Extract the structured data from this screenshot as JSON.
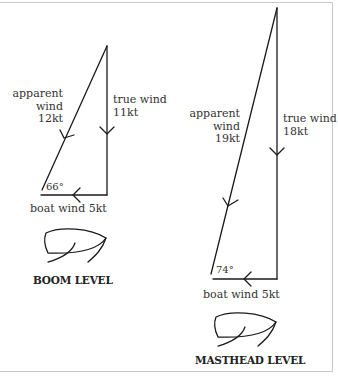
{
  "diagrams": [
    {
      "id": "boom",
      "title": "BOOM LEVEL",
      "apparent_wind": {
        "line1": "apparent",
        "line2": "wind",
        "line3": "12kt"
      },
      "true_wind": {
        "line1": "true wind",
        "line2": "11kt"
      },
      "boat_wind": "boat wind 5kt",
      "angle": "66°"
    },
    {
      "id": "masthead",
      "title": "MASTHEAD LEVEL",
      "apparent_wind": {
        "line1": "apparent",
        "line2": "wind",
        "line3": "19kt"
      },
      "true_wind": {
        "line1": "true wind",
        "line2": "18kt"
      },
      "boat_wind": "boat wind 5kt",
      "angle": "74°"
    }
  ],
  "colors": {
    "line": "#1a1a1a",
    "frame": "#c8c8c8",
    "text": "#333333"
  }
}
